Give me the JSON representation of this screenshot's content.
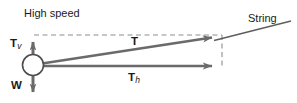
{
  "diagram": {
    "title_visible": false,
    "background_color": "#ffffff",
    "vector_color": "#6a6a6a",
    "dashed_color": "#8e8e8e",
    "text_color": "#1a1a1a",
    "labels": {
      "high_speed": "High speed",
      "string": "String",
      "tension_vertical": "T",
      "tension_vertical_sub": "v",
      "weight": "W",
      "tension": "T",
      "tension_horizontal": "T",
      "tension_horizontal_sub": "h"
    },
    "elements": {
      "bob_name": "ball-bob",
      "bob_center_x": 33,
      "bob_center_y": 65,
      "bob_radius": 11,
      "tension_arrow_from": [
        44,
        63
      ],
      "tension_arrow_to": [
        219,
        37
      ],
      "horizontal_arrow_from": [
        45,
        66
      ],
      "horizontal_arrow_to": [
        219,
        66
      ],
      "vertical_arrow_from": [
        33,
        56
      ],
      "vertical_arrow_to": [
        33,
        36
      ],
      "weight_arrow_from": [
        33,
        75
      ],
      "weight_arrow_to": [
        33,
        97
      ],
      "string_line_from": [
        216,
        40
      ],
      "string_line_to": [
        291,
        21
      ],
      "dashed_top_from": [
        34,
        35
      ],
      "dashed_top_to": [
        222,
        35
      ],
      "dashed_right_from": [
        222,
        35
      ],
      "dashed_right_to": [
        222,
        69
      ]
    }
  }
}
